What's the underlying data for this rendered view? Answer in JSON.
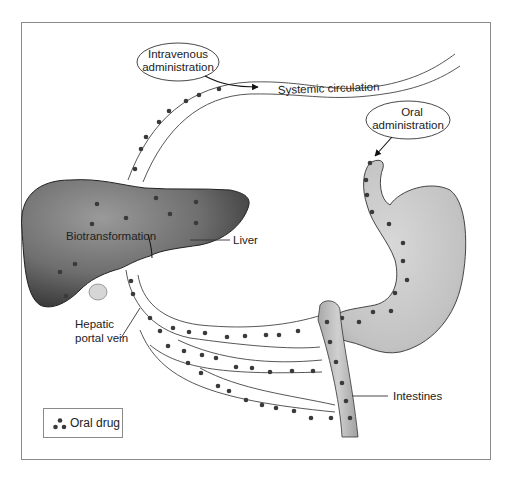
{
  "diagram": {
    "labels": {
      "intravenous": [
        "Intravenous",
        "administration"
      ],
      "systemic": "Systemic circulation",
      "oral": [
        "Oral",
        "administration"
      ],
      "biotransformation": "Biotransformation",
      "liver": "Liver",
      "hepatic_portal_vein": [
        "Hepatic",
        "portal vein"
      ],
      "intestines": "Intestines"
    },
    "legend": {
      "label": "Oral drug",
      "icon": "three-dots-icon"
    },
    "colors": {
      "liver": "#6e6e6e",
      "stomach": "#c4c4c4",
      "dot": "#3a3a3a",
      "outline": "#333333",
      "frame": "#8a8a8a"
    }
  }
}
